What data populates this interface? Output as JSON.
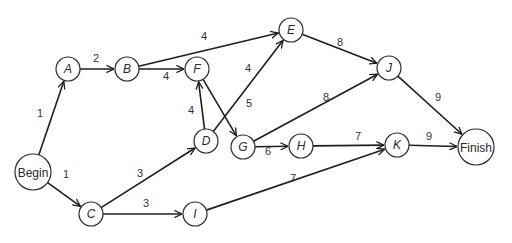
{
  "diagram": {
    "type": "activity-network",
    "nodes": [
      {
        "id": "Begin",
        "label": "Begin",
        "x": 33,
        "y": 172,
        "r": 18,
        "italic": false
      },
      {
        "id": "A",
        "label": "A",
        "x": 68,
        "y": 69,
        "r": 12,
        "italic": true
      },
      {
        "id": "B",
        "label": "B",
        "x": 127,
        "y": 69,
        "r": 12,
        "italic": true
      },
      {
        "id": "F",
        "label": "F",
        "x": 197,
        "y": 69,
        "r": 12,
        "italic": true
      },
      {
        "id": "E",
        "label": "E",
        "x": 291,
        "y": 30,
        "r": 12,
        "italic": true
      },
      {
        "id": "J",
        "label": "J",
        "x": 389,
        "y": 68,
        "r": 12,
        "italic": true
      },
      {
        "id": "D",
        "label": "D",
        "x": 206,
        "y": 141,
        "r": 12,
        "italic": true
      },
      {
        "id": "G",
        "label": "G",
        "x": 243,
        "y": 147,
        "r": 12,
        "italic": true
      },
      {
        "id": "H",
        "label": "H",
        "x": 301,
        "y": 146,
        "r": 12,
        "italic": true
      },
      {
        "id": "K",
        "label": "K",
        "x": 397,
        "y": 145,
        "r": 12,
        "italic": true
      },
      {
        "id": "Finish",
        "label": "Finish",
        "x": 476,
        "y": 147,
        "r": 18,
        "italic": false
      },
      {
        "id": "C",
        "label": "C",
        "x": 91,
        "y": 214,
        "r": 12,
        "italic": true
      },
      {
        "id": "I",
        "label": "I",
        "x": 195,
        "y": 214,
        "r": 12,
        "italic": true
      }
    ],
    "edges": [
      {
        "from": "Begin",
        "to": "A",
        "weight": "1",
        "lx": 40,
        "ly": 117
      },
      {
        "from": "Begin",
        "to": "C",
        "weight": "1",
        "lx": 66,
        "ly": 178
      },
      {
        "from": "A",
        "to": "B",
        "weight": "2",
        "lx": 96,
        "ly": 62
      },
      {
        "from": "B",
        "to": "E",
        "weight": "4",
        "lx": 204,
        "ly": 40
      },
      {
        "from": "B",
        "to": "F",
        "weight": "4",
        "lx": 166,
        "ly": 80
      },
      {
        "from": "D",
        "to": "F",
        "weight": "4",
        "lx": 191,
        "ly": 114
      },
      {
        "from": "D",
        "to": "E",
        "weight": "4",
        "lx": 248,
        "ly": 72
      },
      {
        "from": "F",
        "to": "G",
        "weight": "5",
        "lx": 249,
        "ly": 107
      },
      {
        "from": "E",
        "to": "J",
        "weight": "8",
        "lx": 340,
        "ly": 46
      },
      {
        "from": "G",
        "to": "J",
        "weight": "8",
        "lx": 326,
        "ly": 101
      },
      {
        "from": "G",
        "to": "H",
        "weight": "6",
        "lx": 268,
        "ly": 155
      },
      {
        "from": "H",
        "to": "K",
        "weight": "7",
        "lx": 358,
        "ly": 140
      },
      {
        "from": "K",
        "to": "Finish",
        "weight": "9",
        "lx": 429,
        "ly": 140
      },
      {
        "from": "J",
        "to": "Finish",
        "weight": "9",
        "lx": 438,
        "ly": 101
      },
      {
        "from": "C",
        "to": "D",
        "weight": "3",
        "lx": 140,
        "ly": 177
      },
      {
        "from": "C",
        "to": "I",
        "weight": "3",
        "lx": 146,
        "ly": 207
      },
      {
        "from": "I",
        "to": "K",
        "weight": "7",
        "lx": 293,
        "ly": 182
      }
    ],
    "colors": {
      "stroke": "#1e1e1e",
      "fill": "#ffffff",
      "text": "#2a2a2a"
    }
  }
}
